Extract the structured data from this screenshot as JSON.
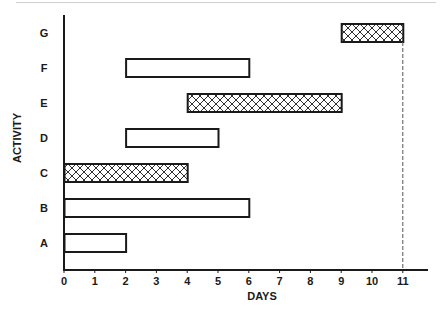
{
  "chart_data": {
    "type": "bar",
    "subtype": "gantt",
    "title": "",
    "xlabel": "DAYS",
    "ylabel": "ACTIVITY",
    "xlim": [
      0,
      11.8
    ],
    "xticks": [
      0,
      1,
      2,
      3,
      4,
      5,
      6,
      7,
      8,
      9,
      10,
      11
    ],
    "categories": [
      "A",
      "B",
      "C",
      "D",
      "E",
      "F",
      "G"
    ],
    "tasks": [
      {
        "activity": "A",
        "start": 0,
        "end": 2,
        "critical": false
      },
      {
        "activity": "B",
        "start": 0,
        "end": 6,
        "critical": false
      },
      {
        "activity": "C",
        "start": 0,
        "end": 4,
        "critical": true
      },
      {
        "activity": "D",
        "start": 2,
        "end": 5,
        "critical": false
      },
      {
        "activity": "E",
        "start": 4,
        "end": 9,
        "critical": true
      },
      {
        "activity": "F",
        "start": 2,
        "end": 6,
        "critical": false
      },
      {
        "activity": "G",
        "start": 9,
        "end": 11,
        "critical": true
      }
    ],
    "reference_line": {
      "x": 11,
      "style": "dashed"
    },
    "legend": null,
    "grid": false,
    "styles": {
      "critical_fill": "crosshatch",
      "noncritical_fill": "#ffffff",
      "stroke": "#1a1a1a"
    }
  }
}
